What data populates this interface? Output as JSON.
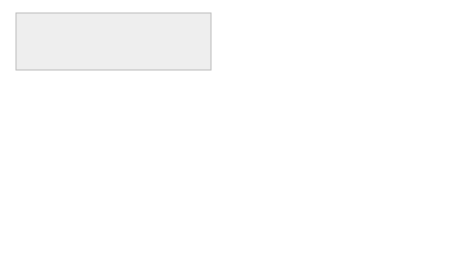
{
  "scene": {
    "description": "Two people viewing a circuit-design screen; a double-headed arrow between them; the right screen shows an open Edit menu",
    "arrow": "double-headed-arrow"
  },
  "left_screen": {
    "panel_items": [
      "Exit",
      "Undo",
      "",
      "Hard copy"
    ]
  },
  "right_screen": {
    "menu": {
      "title": "Edit",
      "groups": [
        [
          "Undo",
          "Redo"
        ],
        [
          "Cut",
          "Copy",
          "Paste",
          "Clear"
        ]
      ]
    },
    "panel_items": [
      "Exit",
      "Undo",
      "Help",
      "Hard copy"
    ]
  },
  "colors": {
    "menu_header": "#c8c8c8",
    "monitor_frame": "#eeeeee",
    "line": "#555555"
  }
}
